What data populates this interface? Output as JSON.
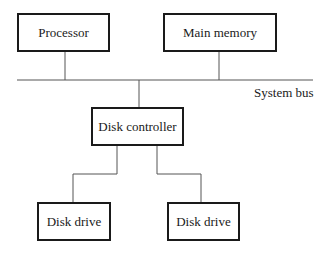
{
  "diagram": {
    "nodes": {
      "processor": {
        "label": "Processor"
      },
      "main_memory": {
        "label": "Main memory"
      },
      "disk_controller": {
        "label": "Disk controller"
      },
      "disk_drive_1": {
        "label": "Disk drive"
      },
      "disk_drive_2": {
        "label": "Disk drive"
      }
    },
    "bus": {
      "label": "System bus"
    },
    "edges": [
      {
        "from": "processor",
        "to": "system-bus"
      },
      {
        "from": "main_memory",
        "to": "system-bus"
      },
      {
        "from": "system-bus",
        "to": "disk_controller"
      },
      {
        "from": "disk_controller",
        "to": "disk_drive_1"
      },
      {
        "from": "disk_controller",
        "to": "disk_drive_2"
      }
    ]
  }
}
